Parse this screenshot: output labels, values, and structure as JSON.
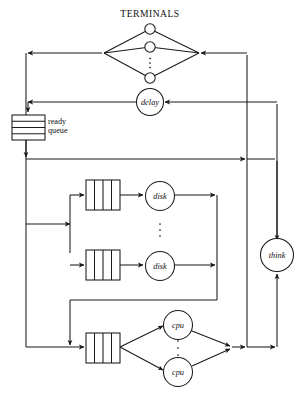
{
  "figure": {
    "type": "queueing-network-diagram",
    "title": "TERMINALS",
    "background": "#ffffff",
    "line_color": "#1a1a1a",
    "text_color": "#111111"
  },
  "labels": {
    "terminals": "TERMINALS",
    "delay": "delay",
    "ready_queue_line1": "ready",
    "ready_queue_line2": "queue",
    "disk_top": "disk",
    "disk_bottom": "disk",
    "cpu_top": "cpu",
    "cpu_bottom": "cpu",
    "think": "think",
    "vertical_ellipsis": "⋮"
  },
  "nodes": [
    {
      "id": "terminal-1",
      "label": "",
      "shape": "circle",
      "cx": 150,
      "cy": 29,
      "r": 5.2
    },
    {
      "id": "terminal-2",
      "label": "",
      "shape": "circle",
      "cx": 150,
      "cy": 47,
      "r": 5.2
    },
    {
      "id": "terminal-n",
      "label": "",
      "shape": "circle",
      "cx": 150,
      "cy": 78,
      "r": 5.2
    },
    {
      "id": "delay",
      "label": "delay",
      "shape": "circle",
      "cx": 150,
      "cy": 102,
      "r": 13.5
    },
    {
      "id": "disk-top",
      "label": "disk",
      "shape": "circle",
      "cx": 160,
      "cy": 196,
      "r": 14.5
    },
    {
      "id": "disk-bottom",
      "label": "disk",
      "shape": "circle",
      "cx": 160,
      "cy": 266,
      "r": 14.5
    },
    {
      "id": "cpu-top",
      "label": "cpu",
      "shape": "circle",
      "cx": 178,
      "cy": 325,
      "r": 14.5
    },
    {
      "id": "cpu-bottom",
      "label": "cpu",
      "shape": "circle",
      "cx": 178,
      "cy": 372,
      "r": 14.5
    },
    {
      "id": "think",
      "label": "think",
      "shape": "circle",
      "cx": 277,
      "cy": 255,
      "r": 16.5
    }
  ],
  "queues": [
    {
      "id": "ready-queue",
      "style": "horizontal-slots",
      "x": 12,
      "y": 115,
      "w": 33,
      "h": 25,
      "slots": 4,
      "label": "ready queue"
    },
    {
      "id": "disk-queue-top",
      "style": "vertical-bars",
      "x": 86,
      "y": 180,
      "w": 34,
      "h": 30,
      "bars": 3
    },
    {
      "id": "disk-queue-bottom",
      "style": "vertical-bars",
      "x": 86,
      "y": 250,
      "w": 34,
      "h": 30,
      "bars": 3
    },
    {
      "id": "cpu-queue",
      "style": "vertical-bars",
      "x": 86,
      "y": 333,
      "w": 34,
      "h": 30,
      "bars": 3
    }
  ],
  "buses": {
    "left_x": 26,
    "right_inner_x": 247,
    "right_outer_x": 277,
    "disk_merge_x": 217,
    "cpu_merge_x": 232,
    "terminals_return_y": 53,
    "delay_y": 102,
    "ready_out_y": 159,
    "disk_return_y": 300,
    "cpu_out_y": 347
  },
  "ellipses_groups": [
    {
      "id": "terminals-dots",
      "x": 150,
      "y_from": 58,
      "y_to": 68
    },
    {
      "id": "disk-dots",
      "x": 160,
      "y_from": 224,
      "y_to": 238
    },
    {
      "id": "cpu-dots",
      "x": 178,
      "y_from": 340,
      "y_to": 356
    }
  ]
}
